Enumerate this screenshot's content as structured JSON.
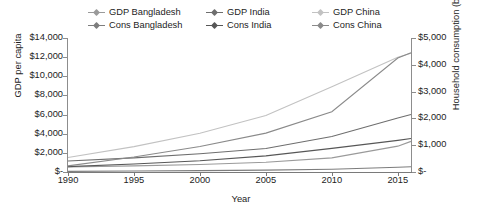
{
  "chart_data": {
    "type": "line",
    "title": "",
    "xlabel": "Year",
    "ylabel": "GDP per capita",
    "y2label": "Household consumption (billion)",
    "x": [
      1990,
      1995,
      2000,
      2005,
      2010,
      2015,
      2016
    ],
    "xlim": [
      1990,
      2016
    ],
    "xticks": [
      1990,
      1995,
      2000,
      2005,
      2010,
      2015
    ],
    "xticklabels": [
      "1990",
      "1995",
      "2000",
      "2005",
      "2010",
      "2015"
    ],
    "ylim": [
      0,
      14000
    ],
    "yticks": [
      0,
      2000,
      4000,
      6000,
      8000,
      10000,
      12000,
      14000
    ],
    "yticklabels": [
      "$-",
      "$2,000",
      "$4,000",
      "$6,000",
      "$8,000",
      "$10,000",
      "$12,000",
      "$14,000"
    ],
    "y2lim": [
      0,
      5000
    ],
    "y2ticks": [
      0,
      1000,
      2000,
      3000,
      4000,
      5000
    ],
    "y2ticklabels": [
      "$-",
      "$1,000",
      "$2,000",
      "$3,000",
      "$4,000",
      "$5,000"
    ],
    "grid": false,
    "legend_position": "top",
    "series": [
      {
        "name": "GDP Bangladesh",
        "axis": "left",
        "color": "#9a9a9a",
        "values": [
          520,
          640,
          790,
          1020,
          1480,
          2700,
          3200
        ]
      },
      {
        "name": "GDP India",
        "axis": "left",
        "color": "#6e6e6e",
        "values": [
          1150,
          1480,
          1900,
          2450,
          3700,
          5650,
          6000
        ]
      },
      {
        "name": "GDP China",
        "axis": "left",
        "color": "#c2c2c2",
        "values": [
          1520,
          2650,
          4050,
          5900,
          8900,
          12000,
          12400
        ]
      },
      {
        "name": "Cons Bangladesh",
        "axis": "right",
        "color": "#7d7d7d",
        "values": [
          25,
          35,
          50,
          70,
          105,
          175,
          195
        ]
      },
      {
        "name": "Cons India",
        "axis": "right",
        "color": "#575757",
        "values": [
          200,
          300,
          420,
          600,
          880,
          1180,
          1250
        ]
      },
      {
        "name": "Cons China",
        "axis": "right",
        "color": "#8a8a8a",
        "values": [
          230,
          560,
          950,
          1450,
          2250,
          4250,
          4450
        ]
      }
    ]
  }
}
